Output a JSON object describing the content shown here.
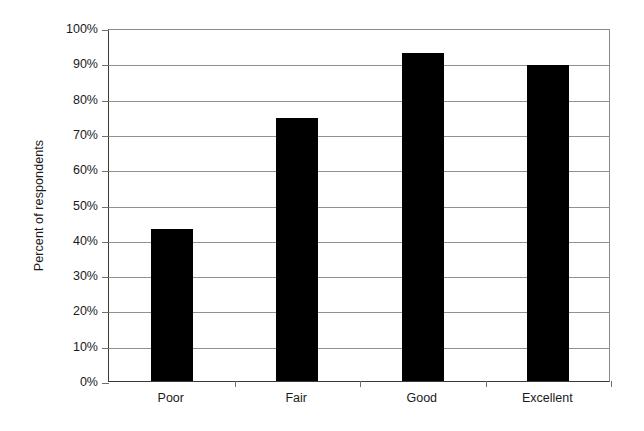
{
  "chart_data": {
    "type": "bar",
    "title": "",
    "subtitle": "",
    "xlabel": "",
    "ylabel": "Percent of respondents",
    "categories": [
      "Poor",
      "Fair",
      "Good",
      "Excellent"
    ],
    "values": [
      43,
      74.5,
      93,
      89.5
    ],
    "value_labels": [
      "43%",
      "74.5%",
      "93%",
      "89.5%"
    ],
    "ylim": [
      0,
      100
    ],
    "ytick_values": [
      0,
      10,
      20,
      30,
      40,
      50,
      60,
      70,
      80,
      90,
      100
    ],
    "ytick_labels": [
      "0%",
      "10%",
      "20%",
      "30%",
      "40%",
      "50%",
      "60%",
      "70%",
      "80%",
      "90%",
      "100%"
    ],
    "grid": "horizontal",
    "legend": "none",
    "bar_color": "#000000",
    "gridline_color": "#909090",
    "axis_color": "#3a3a3a",
    "background_color": "#ffffff",
    "annotations": []
  },
  "axis": {
    "y_title": "Percent of respondents"
  }
}
